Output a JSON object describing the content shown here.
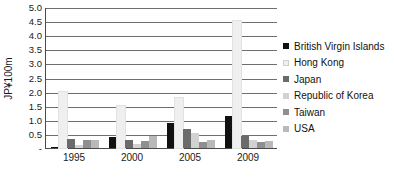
{
  "chart_data": {
    "type": "bar",
    "title": "",
    "subtitle": "",
    "xlabel": "",
    "ylabel": "JP¥100m",
    "categories": [
      "1995",
      "2000",
      "2005",
      "2009"
    ],
    "ylim": [
      0,
      5.0
    ],
    "ytick_values": [
      0,
      0.5,
      1.0,
      1.5,
      2.0,
      2.5,
      3.0,
      3.5,
      4.0,
      4.5,
      5.0
    ],
    "ytick_labels": [
      "-",
      "0.5",
      "1.0",
      "1.5",
      "2.0",
      "2.5",
      "3.0",
      "3.5",
      "4.0",
      "4.5",
      "5.0"
    ],
    "grid": true,
    "grid_axis": "y",
    "legend_position": "right",
    "series": [
      {
        "name": "British Virgin Islands",
        "color": "#111111",
        "values": [
          0.05,
          0.38,
          0.9,
          1.12
        ]
      },
      {
        "name": "Hong Kong",
        "color": "#efefef",
        "values": [
          2.0,
          1.5,
          1.78,
          4.52
        ]
      },
      {
        "name": "Japan",
        "color": "#6b6b6b",
        "values": [
          0.33,
          0.3,
          0.66,
          0.44
        ]
      },
      {
        "name": "Republic of Korea",
        "color": "#d2d2d2",
        "values": [
          0.1,
          0.16,
          0.52,
          0.28
        ]
      },
      {
        "name": "Taiwan",
        "color": "#8f8f8f",
        "values": [
          0.28,
          0.25,
          0.22,
          0.2
        ]
      },
      {
        "name": "USA",
        "color": "#b9b9b9",
        "values": [
          0.3,
          0.42,
          0.3,
          0.25
        ]
      }
    ]
  },
  "style": {
    "axis_color": "#4a4a4a",
    "grid_color": "#6e6e6e",
    "text_color": "#1a1a1a",
    "background": "#ffffff"
  }
}
